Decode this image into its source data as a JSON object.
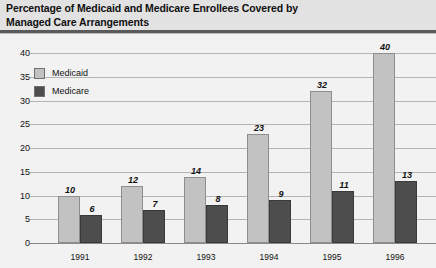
{
  "title": "Percentage of Medicaid and Medicare Enrollees Covered by\nManaged Care Arrangements",
  "legend": {
    "items": [
      {
        "label": "Medicaid",
        "color": "#c2c2c2"
      },
      {
        "label": "Medicare",
        "color": "#4d4d4d"
      }
    ]
  },
  "axis": {
    "y_ticks": [
      "0",
      "5",
      "10",
      "15",
      "20",
      "25",
      "30",
      "35",
      "40"
    ],
    "x_ticks": [
      "1991",
      "1992",
      "1993",
      "1994",
      "1995",
      "1996"
    ]
  },
  "values": {
    "medicaid": [
      "10",
      "12",
      "14",
      "23",
      "32",
      "40"
    ],
    "medicare": [
      "6",
      "7",
      "8",
      "9",
      "11",
      "13"
    ]
  },
  "chart_data": {
    "type": "bar",
    "title": "Percentage of Medicaid and Medicare Enrollees Covered by Managed Care Arrangements",
    "categories": [
      "1991",
      "1992",
      "1993",
      "1994",
      "1995",
      "1996"
    ],
    "series": [
      {
        "name": "Medicaid",
        "color": "#c2c2c2",
        "values": [
          10,
          12,
          14,
          23,
          32,
          40
        ]
      },
      {
        "name": "Medicare",
        "color": "#4d4d4d",
        "values": [
          6,
          7,
          8,
          9,
          11,
          13
        ]
      }
    ],
    "xlabel": "",
    "ylabel": "",
    "ylim": [
      0,
      40
    ],
    "ytick_step": 5,
    "yticks": [
      0,
      5,
      10,
      15,
      20,
      25,
      30,
      35,
      40
    ],
    "grid": true,
    "grid_axis": "y",
    "legend_position": "top-left-inside",
    "data_labels": true,
    "data_label_style": "italic-bold-above-bar"
  }
}
